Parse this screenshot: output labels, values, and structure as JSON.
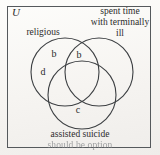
{
  "diagram": {
    "universe_label": "U",
    "sets": [
      {
        "id": "religious",
        "label": "religious"
      },
      {
        "id": "terminally-ill",
        "label_line1": "spent time",
        "label_line2": "with terminally",
        "label_line3": "ill"
      },
      {
        "id": "assisted-suicide",
        "label_line1": "assisted suicide",
        "label_line2": "should be option"
      }
    ],
    "regions": [
      {
        "id": "religious-only",
        "letter": "b"
      },
      {
        "id": "religious-and-terminally-ill",
        "letter": "b"
      },
      {
        "id": "religious-left",
        "letter": "d"
      },
      {
        "id": "assisted-suicide-only",
        "letter": "c"
      }
    ],
    "colors": {
      "ink": "#2b2b2b",
      "stroke": "#3c3f42",
      "border": "#55595c",
      "paper": "#f6f4f1",
      "faded_ink": "#7e8184"
    }
  }
}
